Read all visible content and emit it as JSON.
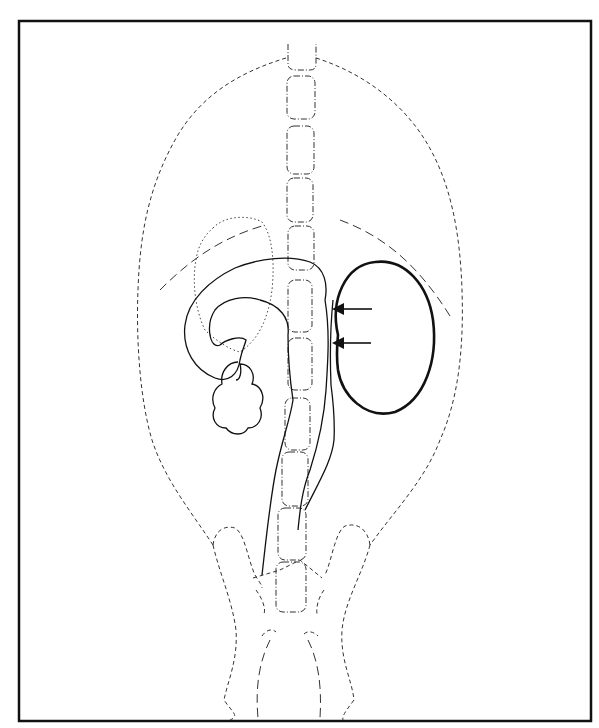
{
  "figure": {
    "type": "anatomical line drawing",
    "background": "#ffffff",
    "stroke_color": "#111111",
    "elements": [
      {
        "name": "frame",
        "style": "solid border"
      },
      {
        "name": "body-outline",
        "style": "dashed"
      },
      {
        "name": "spine-vertebrae",
        "style": "dash-dot",
        "count": 11
      },
      {
        "name": "liver-outline",
        "style": "dotted"
      },
      {
        "name": "diaphragm-left",
        "style": "long dash"
      },
      {
        "name": "diaphragm-right",
        "style": "long dash"
      },
      {
        "name": "stomach-duodenum",
        "style": "solid"
      },
      {
        "name": "kidney-mass",
        "style": "thick solid"
      },
      {
        "name": "ureter-or-vessel",
        "style": "solid double line"
      },
      {
        "name": "pelvis-legs",
        "style": "dashed"
      },
      {
        "name": "arrows",
        "style": "solid with arrowheads",
        "count": 2
      }
    ]
  }
}
